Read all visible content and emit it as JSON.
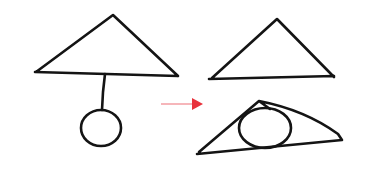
{
  "diagram": {
    "colors": {
      "ink": "#141414",
      "arrow": "#e8323c",
      "background": "#ffffff"
    },
    "before": {
      "triangle": {
        "apex": [
          113,
          15
        ],
        "left": [
          36,
          72
        ],
        "right": [
          178,
          76
        ]
      },
      "stick": {
        "from": [
          105,
          74
        ],
        "to": [
          102,
          110
        ]
      },
      "circle": {
        "cx": 101,
        "cy": 128,
        "r": 19
      }
    },
    "arrow": {
      "from": [
        161,
        104
      ],
      "to": [
        202,
        104
      ],
      "direction": "right"
    },
    "after": {
      "triangle_top": {
        "apex": [
          277,
          19
        ],
        "left": [
          210,
          78
        ],
        "right": [
          334,
          77
        ]
      },
      "triangle_bottom": {
        "apex": [
          259,
          101
        ],
        "left": [
          198,
          153
        ],
        "right": [
          342,
          140
        ]
      },
      "ellipse": {
        "cx": 265,
        "cy": 128,
        "rx": 26,
        "ry": 20
      }
    }
  }
}
